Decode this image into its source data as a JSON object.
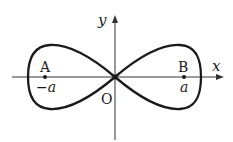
{
  "diagram": {
    "type": "lemniscate",
    "axes": {
      "x_label": "x",
      "y_label": "y",
      "origin_label": "O"
    },
    "points": [
      {
        "name": "A",
        "coord_label": "−a"
      },
      {
        "name": "B",
        "coord_label": "a"
      }
    ],
    "colors": {
      "stroke": "#1a1a1a",
      "background": "#ffffff"
    }
  }
}
